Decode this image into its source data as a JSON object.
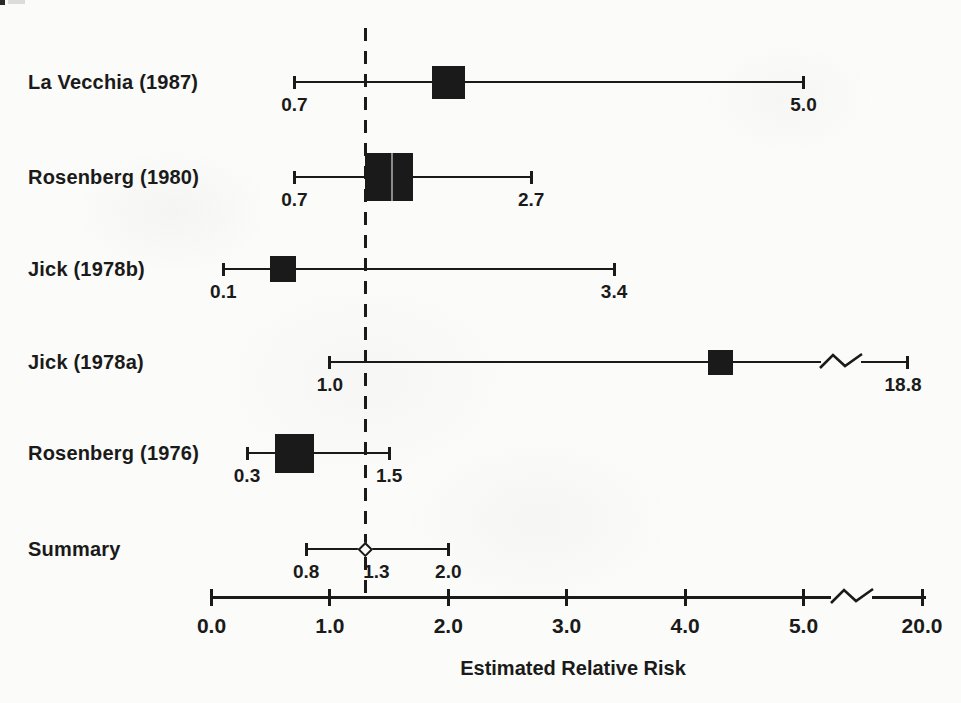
{
  "figure": {
    "ink": "#1a1a1a",
    "background": "#fbfbf9"
  },
  "chart_data": {
    "type": "forest",
    "xlabel": "Estimated Relative Risk",
    "axis": {
      "tick_labels": [
        "0.0",
        "1.0",
        "2.0",
        "3.0",
        "4.0",
        "5.0",
        "20.0"
      ],
      "tick_values": [
        0,
        1,
        2,
        3,
        4,
        5,
        20
      ],
      "linear_range": [
        0,
        5
      ],
      "axis_break_between": [
        5,
        20
      ]
    },
    "reference_line": {
      "value": 1.3,
      "style": "dashed"
    },
    "rows": [
      {
        "label": "La Vecchia (1987)",
        "estimate": 2.0,
        "lower": 0.7,
        "upper": 5.0,
        "lower_label": "0.7",
        "upper_label": "5.0",
        "marker": "square",
        "weight_px": 33
      },
      {
        "label": "Rosenberg (1980)",
        "estimate": 1.5,
        "lower": 0.7,
        "upper": 2.7,
        "lower_label": "0.7",
        "upper_label": "2.7",
        "marker": "square",
        "weight_px": 48
      },
      {
        "label": "Jick (1978b)",
        "estimate": 0.6,
        "lower": 0.1,
        "upper": 3.4,
        "lower_label": "0.1",
        "upper_label": "3.4",
        "marker": "square",
        "weight_px": 26
      },
      {
        "label": "Jick (1978a)",
        "estimate": 4.3,
        "lower": 1.0,
        "upper": 18.8,
        "lower_label": "1.0",
        "upper_label": "18.8",
        "marker": "square",
        "weight_px": 25,
        "ci_line_break": true
      },
      {
        "label": "Rosenberg (1976)",
        "estimate": 0.7,
        "lower": 0.3,
        "upper": 1.5,
        "lower_label": "0.3",
        "upper_label": "1.5",
        "marker": "square",
        "weight_px": 39
      },
      {
        "label": "Summary",
        "estimate": 1.3,
        "lower": 0.8,
        "upper": 2.0,
        "lower_label": "0.8",
        "estimate_label": "1.3",
        "upper_label": "2.0",
        "marker": "diamond"
      }
    ]
  }
}
